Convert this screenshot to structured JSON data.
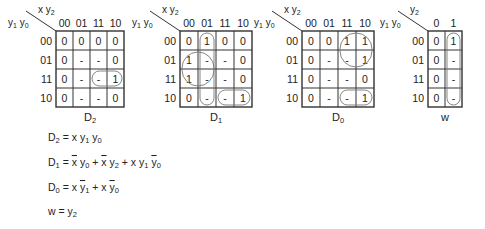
{
  "maps": [
    {
      "id": "D2",
      "title_main": "D",
      "title_sub": "2",
      "col_var": "x y",
      "col_var_sub": "2",
      "row_var": "y",
      "row_var_sub1": "1",
      "row_var_mid": " y",
      "row_var_sub2": "0",
      "cols": [
        "00",
        "01",
        "11",
        "10"
      ],
      "rows": [
        "00",
        "01",
        "11",
        "10"
      ],
      "cells": [
        [
          "0",
          "0",
          "0",
          "0"
        ],
        [
          "0",
          "-",
          "-",
          "0"
        ],
        [
          "0",
          "-",
          "-",
          "1"
        ],
        [
          "0",
          "-",
          "-",
          "0"
        ]
      ],
      "x": 56,
      "y": 31,
      "cw": 17,
      "ch": 19,
      "groups": [
        {
          "r0": 2,
          "c0": 2,
          "r1": 2,
          "c1": 3
        }
      ]
    },
    {
      "id": "D1",
      "title_main": "D",
      "title_sub": "1",
      "col_var": "x y",
      "col_var_sub": "2",
      "row_var": "y",
      "row_var_sub1": "1",
      "row_var_mid": " y",
      "row_var_sub2": "0",
      "cols": [
        "00",
        "01",
        "11",
        "10"
      ],
      "rows": [
        "00",
        "01",
        "11",
        "10"
      ],
      "cells": [
        [
          "0",
          "1",
          "0",
          "0"
        ],
        [
          "1",
          "-",
          "-",
          "0"
        ],
        [
          "1",
          "-",
          "-",
          "0"
        ],
        [
          "0",
          "-",
          "-",
          "1"
        ]
      ],
      "x": 180,
      "y": 31,
      "cw": 18,
      "ch": 19,
      "groups": [
        {
          "r0": 0,
          "c0": 1,
          "r1": 3,
          "c1": 1
        },
        {
          "r0": 1,
          "c0": 0,
          "r1": 2,
          "c1": 1
        },
        {
          "r0": 3,
          "c0": 2,
          "r1": 3,
          "c1": 3
        }
      ]
    },
    {
      "id": "D0",
      "title_main": "D",
      "title_sub": "0",
      "col_var": "x y",
      "col_var_sub": "2",
      "row_var": "y",
      "row_var_sub1": "1",
      "row_var_mid": " y",
      "row_var_sub2": "0",
      "cols": [
        "00",
        "01",
        "11",
        "10"
      ],
      "rows": [
        "00",
        "01",
        "11",
        "10"
      ],
      "cells": [
        [
          "0",
          "0",
          "1",
          "1"
        ],
        [
          "0",
          "-",
          "-",
          "1"
        ],
        [
          "0",
          "-",
          "-",
          "0"
        ],
        [
          "0",
          "-",
          "-",
          "1"
        ]
      ],
      "x": 302,
      "y": 31,
      "cw": 18,
      "ch": 19,
      "groups": [
        {
          "r0": 0,
          "c0": 2,
          "r1": 1,
          "c1": 3
        },
        {
          "r0": 3,
          "c0": 2,
          "r1": 3,
          "c1": 3
        }
      ]
    },
    {
      "id": "w",
      "title_main": "w",
      "title_sub": "",
      "col_var": "y",
      "col_var_sub": "2",
      "row_var": "y",
      "row_var_sub1": "1",
      "row_var_mid": " y",
      "row_var_sub2": "0",
      "cols": [
        "0",
        "1"
      ],
      "rows": [
        "00",
        "01",
        "11",
        "10"
      ],
      "cells": [
        [
          "0",
          "1"
        ],
        [
          "0",
          "-"
        ],
        [
          "0",
          "-"
        ],
        [
          "0",
          "-"
        ]
      ],
      "x": 428,
      "y": 31,
      "cw": 17,
      "ch": 19,
      "groups": [
        {
          "r0": 0,
          "c0": 1,
          "r1": 3,
          "c1": 1
        }
      ]
    }
  ],
  "equations": [
    {
      "id": "eq-d2",
      "parts": [
        {
          "t": "D"
        },
        {
          "t": "2",
          "sub": true
        },
        {
          "t": " = x y"
        },
        {
          "t": "1",
          "sub": true
        },
        {
          "t": " y"
        },
        {
          "t": "0",
          "sub": true
        }
      ]
    },
    {
      "id": "eq-d1",
      "parts": [
        {
          "t": "D"
        },
        {
          "t": "1",
          "sub": true
        },
        {
          "t": " = "
        },
        {
          "t": "x",
          "bar": true
        },
        {
          "t": " y"
        },
        {
          "t": "0",
          "sub": true
        },
        {
          "t": " + "
        },
        {
          "t": "x",
          "bar": true
        },
        {
          "t": " y"
        },
        {
          "t": "2",
          "sub": true
        },
        {
          "t": " + x y"
        },
        {
          "t": "1",
          "sub": true
        },
        {
          "t": " "
        },
        {
          "t": "y",
          "bar": true
        },
        {
          "t": "0",
          "sub": true
        }
      ]
    },
    {
      "id": "eq-d0",
      "parts": [
        {
          "t": "D"
        },
        {
          "t": "0",
          "sub": true
        },
        {
          "t": " = x "
        },
        {
          "t": "y",
          "bar": true
        },
        {
          "t": "1",
          "sub": true
        },
        {
          "t": " + x "
        },
        {
          "t": "y",
          "bar": true
        },
        {
          "t": "0",
          "sub": true
        }
      ]
    },
    {
      "id": "eq-w",
      "parts": [
        {
          "t": "w = y"
        },
        {
          "t": "2",
          "sub": true
        }
      ]
    }
  ],
  "colors": {
    "line": "#333333",
    "text": "#222222",
    "group": "#777777"
  }
}
